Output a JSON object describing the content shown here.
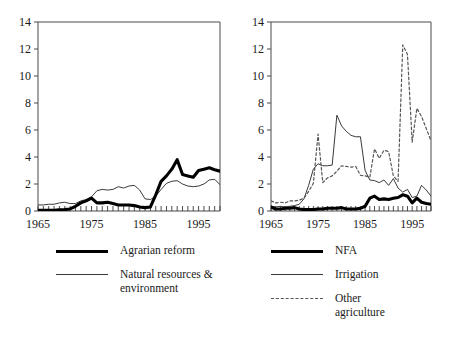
{
  "figure": {
    "background": "#ffffff",
    "ink": "#1a1a1a"
  },
  "chart_data": [
    {
      "panel": "left",
      "type": "line",
      "title": "",
      "xlabel": "",
      "ylabel": "",
      "xlim": [
        1965,
        1999
      ],
      "ylim": [
        0,
        14
      ],
      "yticks": [
        0,
        2,
        4,
        6,
        8,
        10,
        12,
        14
      ],
      "xticks": [
        1965,
        1975,
        1985,
        1995
      ],
      "xtick_labels": [
        "1965",
        "1975",
        "1985",
        "1995"
      ],
      "ytick_labels": [
        "0",
        "2",
        "4",
        "6",
        "8",
        "10",
        "12",
        "14"
      ],
      "minor_xticks": true,
      "grid": false,
      "legend_position": "below",
      "x": [
        1965,
        1966,
        1967,
        1968,
        1969,
        1970,
        1971,
        1972,
        1973,
        1974,
        1975,
        1976,
        1977,
        1978,
        1979,
        1980,
        1981,
        1982,
        1983,
        1984,
        1985,
        1986,
        1987,
        1988,
        1989,
        1990,
        1991,
        1992,
        1993,
        1994,
        1995,
        1996,
        1997,
        1998,
        1999
      ],
      "series": [
        {
          "name": "Agrarian reform",
          "style": "thick-solid",
          "color": "#000000",
          "values": [
            0.05,
            0.05,
            0.05,
            0.05,
            0.08,
            0.1,
            0.15,
            0.35,
            0.6,
            0.75,
            0.95,
            0.6,
            0.6,
            0.65,
            0.55,
            0.45,
            0.45,
            0.45,
            0.4,
            0.3,
            0.25,
            0.3,
            1.2,
            2.2,
            2.6,
            3.1,
            3.8,
            2.7,
            2.6,
            2.5,
            3.0,
            3.1,
            3.2,
            3.05,
            2.95
          ]
        },
        {
          "name": "Natural resources & environment",
          "style": "thin-solid",
          "color": "#3a3a3a",
          "values": [
            0.45,
            0.45,
            0.5,
            0.5,
            0.6,
            0.65,
            0.55,
            0.55,
            0.75,
            0.85,
            1.05,
            1.5,
            1.6,
            1.55,
            1.6,
            1.8,
            1.7,
            1.85,
            1.9,
            1.55,
            0.9,
            0.85,
            1.1,
            1.6,
            2.05,
            2.2,
            2.25,
            2.0,
            1.85,
            1.8,
            1.85,
            2.0,
            2.3,
            2.35,
            1.95
          ]
        }
      ]
    },
    {
      "panel": "right",
      "type": "line",
      "title": "",
      "xlabel": "",
      "ylabel": "",
      "xlim": [
        1965,
        1999
      ],
      "ylim": [
        0,
        14
      ],
      "yticks": [
        0,
        2,
        4,
        6,
        8,
        10,
        12,
        14
      ],
      "xticks": [
        1965,
        1975,
        1985,
        1995
      ],
      "xtick_labels": [
        "1965",
        "1975",
        "1985",
        "1995"
      ],
      "ytick_labels": [
        "0",
        "2",
        "4",
        "6",
        "8",
        "10",
        "12",
        "14"
      ],
      "minor_xticks": true,
      "grid": false,
      "legend_position": "below",
      "x": [
        1965,
        1966,
        1967,
        1968,
        1969,
        1970,
        1971,
        1972,
        1973,
        1974,
        1975,
        1976,
        1977,
        1978,
        1979,
        1980,
        1981,
        1982,
        1983,
        1984,
        1985,
        1986,
        1987,
        1988,
        1989,
        1990,
        1991,
        1992,
        1993,
        1994,
        1995,
        1996,
        1997,
        1998,
        1999
      ],
      "series": [
        {
          "name": "NFA",
          "style": "thick-solid",
          "color": "#000000",
          "values": [
            0.3,
            0.15,
            0.15,
            0.2,
            0.2,
            0.25,
            0.15,
            0.1,
            0.1,
            0.1,
            0.15,
            0.15,
            0.2,
            0.2,
            0.2,
            0.25,
            0.15,
            0.15,
            0.15,
            0.2,
            0.35,
            0.95,
            1.1,
            0.85,
            0.9,
            0.85,
            0.95,
            1.0,
            1.2,
            1.1,
            0.6,
            0.95,
            0.65,
            0.55,
            0.5
          ]
        },
        {
          "name": "Irrigation",
          "style": "thin-solid",
          "color": "#3a3a3a",
          "values": [
            0.35,
            0.3,
            0.35,
            0.3,
            0.35,
            0.4,
            0.5,
            0.9,
            1.9,
            3.1,
            3.5,
            3.35,
            3.35,
            3.4,
            7.1,
            6.3,
            5.9,
            5.6,
            5.5,
            5.5,
            3.0,
            2.3,
            2.25,
            2.1,
            2.3,
            1.9,
            2.4,
            1.7,
            1.4,
            1.6,
            1.0,
            1.1,
            1.9,
            1.55,
            1.1
          ]
        },
        {
          "name": "Other agriculture",
          "style": "dashed",
          "color": "#555555",
          "values": [
            0.75,
            0.6,
            0.65,
            0.6,
            0.75,
            0.75,
            0.8,
            0.95,
            1.45,
            2.05,
            5.7,
            2.1,
            2.45,
            2.6,
            2.95,
            3.35,
            3.3,
            3.25,
            3.3,
            2.65,
            2.6,
            2.5,
            4.6,
            3.9,
            4.5,
            4.4,
            2.6,
            2.2,
            12.3,
            11.6,
            5.1,
            7.6,
            7.0,
            6.1,
            5.2
          ]
        }
      ]
    }
  ],
  "legends": {
    "left": [
      {
        "label": "Agrarian reform",
        "style": "thick-solid"
      },
      {
        "label": "Natural resources &\nenvironment",
        "style": "thin-solid"
      }
    ],
    "right": [
      {
        "label": "NFA",
        "style": "thick-solid"
      },
      {
        "label": "Irrigation",
        "style": "thin-solid"
      },
      {
        "label": "Other\nagriculture",
        "style": "dashed"
      }
    ]
  }
}
